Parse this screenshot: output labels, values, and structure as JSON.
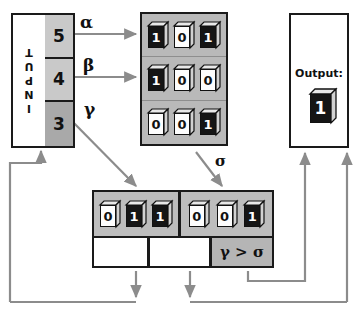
{
  "diagram": {
    "background": "#ffffff",
    "line_color": "#8c8c8c",
    "border_color": "#1a1a1a"
  },
  "input_block": {
    "label": "INPUT",
    "cells": [
      {
        "value": "5",
        "fill": "#c9c9c9"
      },
      {
        "value": "4",
        "fill": "#c9c9c9"
      },
      {
        "value": "3",
        "fill": "#a9a9a9"
      }
    ]
  },
  "edge_labels": {
    "alpha": "α",
    "beta": "β",
    "gamma": "γ",
    "sigma": "σ"
  },
  "register_grid": {
    "fill": "#b9b9b9",
    "rows": [
      {
        "name": "row-alpha",
        "bits": [
          "1",
          "0",
          "1"
        ]
      },
      {
        "name": "row-beta",
        "bits": [
          "1",
          "0",
          "0"
        ]
      },
      {
        "name": "row-sigma",
        "bits": [
          "0",
          "0",
          "1"
        ]
      }
    ]
  },
  "bottom_registers": {
    "fill": "#bdbdbd",
    "groups": [
      {
        "name": "group-gamma",
        "bits": [
          "0",
          "1",
          "1"
        ]
      },
      {
        "name": "group-sigma",
        "bits": [
          "0",
          "0",
          "1"
        ]
      }
    ],
    "sub_cells": [
      {
        "text": "",
        "fill": "#ffffff"
      },
      {
        "text": "",
        "fill": "#ffffff"
      },
      {
        "text": "γ > σ",
        "fill": "#b5b5b5"
      }
    ]
  },
  "output_block": {
    "title": "Output:",
    "bit": "1"
  }
}
